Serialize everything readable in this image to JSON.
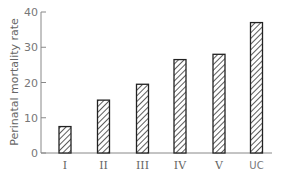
{
  "chart_data": {
    "type": "bar",
    "title": "",
    "xlabel": "",
    "ylabel": "Perinatal mortality rate",
    "categories": [
      "I",
      "II",
      "III",
      "IV",
      "V",
      "UC"
    ],
    "values": [
      7.5,
      15,
      19.5,
      26.5,
      28,
      37
    ],
    "ylim": [
      0,
      40
    ],
    "yticks": [
      0,
      10,
      20,
      30,
      40
    ],
    "grid": false,
    "legend": null,
    "bar_style": "diagonal-hatched, black outline"
  }
}
